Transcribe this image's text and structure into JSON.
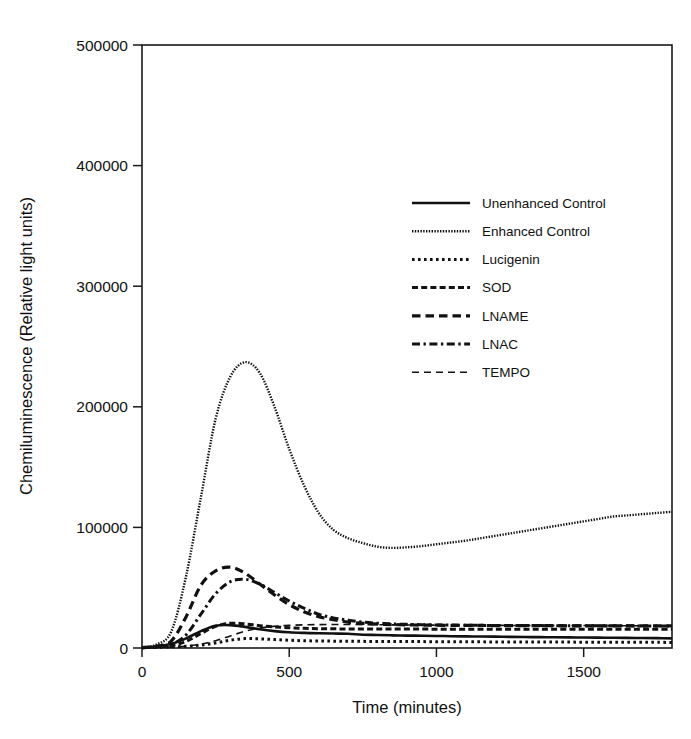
{
  "chart_data": {
    "type": "line",
    "title": "",
    "xlabel": "Time (minutes)",
    "ylabel": "Chemiluminescence (Relative light units)",
    "xlim": [
      0,
      1800
    ],
    "ylim": [
      0,
      500000
    ],
    "xticks": [
      0,
      500,
      1000,
      1500
    ],
    "xtick_labels": [
      "0",
      "500",
      "1000",
      "1500"
    ],
    "yticks": [
      0,
      100000,
      200000,
      300000,
      400000,
      500000
    ],
    "ytick_labels": [
      "0",
      "100000",
      "200000",
      "300000",
      "400000",
      "500000"
    ],
    "grid": false,
    "legend_position": "upper center",
    "x": [
      0,
      50,
      100,
      150,
      200,
      250,
      300,
      350,
      400,
      450,
      500,
      550,
      600,
      650,
      700,
      750,
      800,
      850,
      900,
      950,
      1000,
      1050,
      1100,
      1150,
      1200,
      1250,
      1300,
      1350,
      1400,
      1450,
      1500,
      1550,
      1600,
      1650,
      1700,
      1750,
      1800
    ],
    "series": [
      {
        "name": "Unenhanced Control",
        "dash": "solid",
        "width": 2.6,
        "values": [
          400,
          1200,
          3500,
          8000,
          14000,
          18500,
          19000,
          17500,
          15500,
          14000,
          13000,
          12500,
          12200,
          12000,
          11800,
          11000,
          10800,
          10500,
          10300,
          10200,
          10000,
          9800,
          9600,
          9500,
          9400,
          9200,
          9100,
          9000,
          8900,
          8800,
          8700,
          8600,
          8500,
          8400,
          8300,
          8200,
          8000
        ]
      },
      {
        "name": "Enhanced Control",
        "dash": "fine-dot",
        "width": 2.4,
        "values": [
          500,
          3000,
          14000,
          60000,
          125000,
          190000,
          225000,
          237000,
          228000,
          200000,
          165000,
          135000,
          112000,
          98000,
          91000,
          87000,
          84000,
          83000,
          83500,
          84500,
          86000,
          87500,
          89000,
          91000,
          93000,
          95000,
          97000,
          99000,
          101000,
          103000,
          105000,
          107000,
          109000,
          110000,
          111000,
          112000,
          113000
        ]
      },
      {
        "name": "Lucigenin",
        "dash": "dotted",
        "width": 3.0,
        "values": [
          200,
          500,
          900,
          1400,
          2400,
          4200,
          6500,
          7800,
          7600,
          7000,
          6400,
          6000,
          5800,
          5700,
          5600,
          5500,
          5400,
          5400,
          5300,
          5300,
          5200,
          5200,
          5100,
          5100,
          5000,
          5000,
          5000,
          4900,
          4900,
          4900,
          4800,
          4800,
          4800,
          4700,
          4700,
          4700,
          4600
        ]
      },
      {
        "name": "SOD",
        "dash": "dash-short",
        "width": 3.0,
        "values": [
          300,
          800,
          2000,
          5500,
          12000,
          18000,
          20500,
          20000,
          18500,
          17500,
          16800,
          16300,
          16000,
          15900,
          15800,
          15800,
          15700,
          15700,
          15700,
          15700,
          15600,
          15600,
          15600,
          15600,
          15600,
          15600,
          15500,
          15500,
          15500,
          15500,
          15500,
          15500,
          15500,
          15500,
          15500,
          15500,
          15500
        ]
      },
      {
        "name": "LNAME",
        "dash": "dashed",
        "width": 3.2,
        "values": [
          400,
          1500,
          6000,
          26000,
          52000,
          64000,
          67000,
          62000,
          53000,
          44000,
          36000,
          30000,
          26000,
          23500,
          21500,
          20500,
          19800,
          19400,
          19200,
          19000,
          18900,
          18800,
          18700,
          18700,
          18600,
          18600,
          18500,
          18500,
          18500,
          18400,
          18400,
          18400,
          18300,
          18300,
          18300,
          18300,
          18300
        ]
      },
      {
        "name": "LNAC",
        "dash": "dash-dot",
        "width": 3.0,
        "values": [
          300,
          1000,
          3000,
          11000,
          28000,
          45000,
          55000,
          57000,
          53000,
          46000,
          39000,
          33000,
          28000,
          25000,
          23000,
          21500,
          20500,
          20000,
          19600,
          19300,
          19100,
          19000,
          18900,
          18800,
          18700,
          18700,
          18600,
          18600,
          18500,
          18500,
          18500,
          18400,
          18400,
          18400,
          18300,
          18300,
          18300
        ]
      },
      {
        "name": "TEMPO",
        "dash": "dash-long",
        "width": 1.6,
        "values": [
          200,
          400,
          800,
          1600,
          3200,
          6000,
          10000,
          14000,
          16500,
          18000,
          18800,
          19200,
          19400,
          19500,
          19500,
          19400,
          19300,
          19200,
          19100,
          19000,
          19000,
          18900,
          18900,
          18800,
          18800,
          18700,
          18700,
          18700,
          18600,
          18600,
          18600,
          18600,
          18500,
          18500,
          18500,
          18500,
          18500
        ]
      }
    ]
  },
  "legend": {
    "entries": [
      {
        "label": "Unenhanced Control"
      },
      {
        "label": "Enhanced Control"
      },
      {
        "label": "Lucigenin"
      },
      {
        "label": "SOD"
      },
      {
        "label": "LNAME"
      },
      {
        "label": "LNAC"
      },
      {
        "label": "TEMPO"
      }
    ]
  }
}
